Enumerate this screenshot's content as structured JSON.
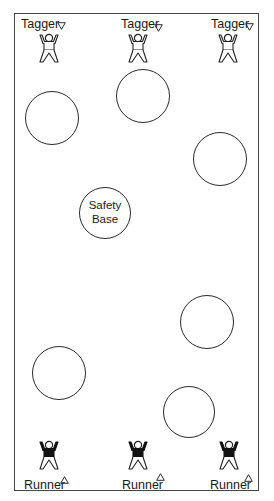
{
  "diagram": {
    "type": "tag-game-field-layout",
    "colors": {
      "line": "#2a2a2a",
      "border": "#444444",
      "text": "#1a1a1a",
      "background": "#ffffff",
      "runner_shirt": "#111111",
      "tagger_shirt": "#ffffff"
    },
    "field": {
      "x": 14,
      "y": 13,
      "width": 245,
      "height": 478
    },
    "taggers": [
      {
        "label": "Tagger",
        "marker": "down-triangle",
        "label_x": 21,
        "label_y": 17,
        "marker_x": 57,
        "marker_y": 22,
        "figure_x": 37,
        "figure_y": 33
      },
      {
        "label": "Tagger",
        "marker": "down-triangle",
        "label_x": 121,
        "label_y": 17,
        "marker_x": 154,
        "marker_y": 24,
        "figure_x": 126,
        "figure_y": 33
      },
      {
        "label": "Tagger",
        "marker": "down-triangle",
        "label_x": 211,
        "label_y": 17,
        "marker_x": 245,
        "marker_y": 23,
        "figure_x": 216,
        "figure_y": 33
      }
    ],
    "runners": [
      {
        "label": "Runner",
        "marker": "up-triangle",
        "label_x": 24,
        "label_y": 478,
        "marker_x": 60,
        "marker_y": 476,
        "figure_x": 37,
        "figure_y": 440
      },
      {
        "label": "Runner",
        "marker": "up-triangle",
        "label_x": 122,
        "label_y": 478,
        "marker_x": 156,
        "marker_y": 473,
        "figure_x": 126,
        "figure_y": 440
      },
      {
        "label": "Runner",
        "marker": "up-triangle",
        "label_x": 210,
        "label_y": 478,
        "marker_x": 244,
        "marker_y": 474,
        "figure_x": 217,
        "figure_y": 440
      }
    ],
    "circles": [
      {
        "cx": 52,
        "cy": 118,
        "r": 27,
        "label": ""
      },
      {
        "cx": 143,
        "cy": 96,
        "r": 27,
        "label": ""
      },
      {
        "cx": 220,
        "cy": 159,
        "r": 27,
        "label": ""
      },
      {
        "cx": 105,
        "cy": 213,
        "r": 26,
        "label": "Safety Base",
        "label_lines": [
          "Safety",
          "Base"
        ]
      },
      {
        "cx": 207,
        "cy": 322,
        "r": 27,
        "label": ""
      },
      {
        "cx": 59,
        "cy": 373,
        "r": 27,
        "label": ""
      },
      {
        "cx": 189,
        "cy": 412,
        "r": 26,
        "label": ""
      }
    ]
  }
}
